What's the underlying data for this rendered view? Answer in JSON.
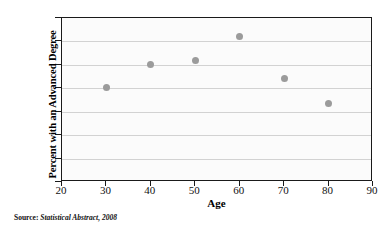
{
  "chart_data": {
    "type": "scatter",
    "title": "",
    "xlabel": "Age",
    "ylabel": "Percent with an Advanced Degree",
    "xlim": [
      20,
      90
    ],
    "ylim": [
      0,
      14
    ],
    "xticks": [
      20,
      30,
      40,
      50,
      60,
      70,
      80,
      90
    ],
    "yticks": [
      0,
      2,
      4,
      6,
      8,
      10,
      12,
      14
    ],
    "xtick_labels": [
      "20",
      "30",
      "40",
      "50",
      "60",
      "70",
      "80",
      "90"
    ],
    "ytick_labels": [
      "0",
      "2",
      "4",
      "6",
      "8",
      "10",
      "12",
      "14"
    ],
    "grid": "horizontal",
    "legend": "none",
    "marker_color": "#9b9b9b",
    "points": [
      {
        "x": 30,
        "y": 8.1
      },
      {
        "x": 40,
        "y": 10.0
      },
      {
        "x": 50,
        "y": 10.35
      },
      {
        "x": 60,
        "y": 12.45
      },
      {
        "x": 70,
        "y": 8.8
      },
      {
        "x": 80,
        "y": 6.7
      }
    ],
    "x": [
      30,
      40,
      50,
      60,
      70,
      80
    ],
    "values": [
      8.1,
      10.0,
      10.35,
      12.45,
      8.8,
      6.7
    ]
  },
  "source": {
    "label": "Source:",
    "text": "Statistical Abstract, 2008"
  }
}
